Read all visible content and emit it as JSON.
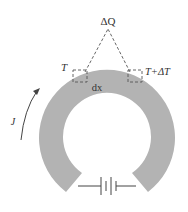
{
  "diagram": {
    "labels": {
      "heat": "ΔQ",
      "temp_left": "T",
      "temp_right": "T+ΔT",
      "element": "dx",
      "current": "J"
    },
    "colors": {
      "ring": "#b3b3b3",
      "line": "#444444",
      "dashed": "#555555",
      "background": "#ffffff"
    },
    "components": [
      {
        "name": "conducting-ring",
        "type": "annular sector with gap at bottom"
      },
      {
        "name": "battery",
        "type": "two-cell battery connecting ring ends"
      },
      {
        "name": "current-arrow",
        "type": "curved arrow on left indicating direction of J"
      },
      {
        "name": "volume-element-left",
        "type": "dashed box at temperature T"
      },
      {
        "name": "volume-element-right",
        "type": "dashed box at temperature T+ΔT"
      },
      {
        "name": "heat-triangle",
        "type": "dashed lines from boxes meeting at ΔQ"
      }
    ]
  }
}
